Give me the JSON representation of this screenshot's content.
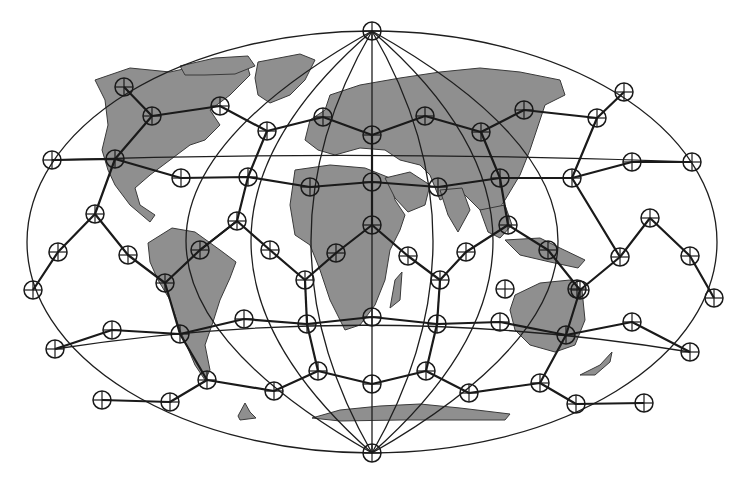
{
  "figure": {
    "type": "world-map-geodesic-network",
    "projection": "elliptical (Mollweide-like)",
    "colors": {
      "background": "#ffffff",
      "land": "#8f8f8f",
      "lines": "#1a1a1a"
    },
    "ellipse": {
      "cx": 372,
      "cy": 242,
      "rx": 345,
      "ry": 211
    }
  },
  "poles": [
    {
      "name": "north-pole-node",
      "x": 372,
      "y": 31
    },
    {
      "name": "south-pole-node",
      "x": 372,
      "y": 453
    }
  ],
  "nodes": [
    [
      124,
      87
    ],
    [
      152,
      116
    ],
    [
      220,
      106
    ],
    [
      267,
      131
    ],
    [
      323,
      117
    ],
    [
      372,
      135
    ],
    [
      425,
      116
    ],
    [
      481,
      132
    ],
    [
      524,
      110
    ],
    [
      597,
      118
    ],
    [
      624,
      92
    ],
    [
      52,
      160
    ],
    [
      115,
      159
    ],
    [
      181,
      178
    ],
    [
      248,
      177
    ],
    [
      310,
      187
    ],
    [
      372,
      182
    ],
    [
      438,
      187
    ],
    [
      500,
      178
    ],
    [
      572,
      178
    ],
    [
      632,
      162
    ],
    [
      692,
      162
    ],
    [
      95,
      214
    ],
    [
      128,
      255
    ],
    [
      58,
      252
    ],
    [
      200,
      250
    ],
    [
      237,
      221
    ],
    [
      270,
      250
    ],
    [
      336,
      253
    ],
    [
      372,
      225
    ],
    [
      408,
      256
    ],
    [
      466,
      252
    ],
    [
      508,
      225
    ],
    [
      548,
      250
    ],
    [
      580,
      290
    ],
    [
      620,
      257
    ],
    [
      650,
      218
    ],
    [
      690,
      256
    ],
    [
      714,
      298
    ],
    [
      33,
      290
    ],
    [
      165,
      283
    ],
    [
      305,
      280
    ],
    [
      372,
      317
    ],
    [
      440,
      280
    ],
    [
      505,
      289
    ],
    [
      577,
      289
    ],
    [
      55,
      349
    ],
    [
      112,
      330
    ],
    [
      180,
      334
    ],
    [
      244,
      319
    ],
    [
      307,
      324
    ],
    [
      437,
      324
    ],
    [
      500,
      322
    ],
    [
      566,
      335
    ],
    [
      632,
      322
    ],
    [
      690,
      352
    ],
    [
      102,
      400
    ],
    [
      170,
      402
    ],
    [
      207,
      380
    ],
    [
      274,
      391
    ],
    [
      318,
      371
    ],
    [
      372,
      384
    ],
    [
      426,
      371
    ],
    [
      469,
      393
    ],
    [
      540,
      383
    ],
    [
      576,
      404
    ],
    [
      644,
      403
    ]
  ],
  "edges": [
    [
      [
        124,
        87
      ],
      [
        152,
        116
      ],
      [
        220,
        106
      ],
      [
        267,
        131
      ],
      [
        323,
        117
      ],
      [
        372,
        135
      ],
      [
        425,
        116
      ],
      [
        481,
        132
      ],
      [
        524,
        110
      ],
      [
        597,
        118
      ],
      [
        624,
        92
      ]
    ],
    [
      [
        52,
        160
      ],
      [
        115,
        159
      ],
      [
        181,
        178
      ],
      [
        248,
        177
      ],
      [
        310,
        187
      ],
      [
        372,
        182
      ],
      [
        438,
        187
      ],
      [
        500,
        178
      ],
      [
        572,
        178
      ],
      [
        632,
        162
      ],
      [
        692,
        162
      ]
    ],
    [
      [
        152,
        116
      ],
      [
        115,
        159
      ],
      [
        95,
        214
      ],
      [
        58,
        252
      ],
      [
        33,
        290
      ]
    ],
    [
      [
        267,
        131
      ],
      [
        248,
        177
      ],
      [
        237,
        221
      ]
    ],
    [
      [
        372,
        135
      ],
      [
        372,
        182
      ],
      [
        372,
        225
      ]
    ],
    [
      [
        481,
        132
      ],
      [
        500,
        178
      ],
      [
        508,
        225
      ]
    ],
    [
      [
        597,
        118
      ],
      [
        572,
        178
      ],
      [
        620,
        257
      ]
    ],
    [
      [
        95,
        214
      ],
      [
        128,
        255
      ],
      [
        165,
        283
      ],
      [
        200,
        250
      ],
      [
        237,
        221
      ],
      [
        270,
        250
      ]
    ],
    [
      [
        237,
        221
      ],
      [
        200,
        250
      ]
    ],
    [
      [
        270,
        250
      ],
      [
        305,
        280
      ],
      [
        336,
        253
      ],
      [
        372,
        225
      ],
      [
        408,
        256
      ],
      [
        440,
        280
      ],
      [
        466,
        252
      ],
      [
        508,
        225
      ],
      [
        548,
        250
      ],
      [
        580,
        290
      ],
      [
        620,
        257
      ],
      [
        650,
        218
      ]
    ],
    [
      [
        650,
        218
      ],
      [
        690,
        256
      ],
      [
        714,
        298
      ]
    ],
    [
      [
        305,
        280
      ],
      [
        307,
        324
      ]
    ],
    [
      [
        440,
        280
      ],
      [
        437,
        324
      ]
    ],
    [
      [
        165,
        283
      ],
      [
        180,
        334
      ],
      [
        207,
        380
      ]
    ],
    [
      [
        580,
        290
      ],
      [
        566,
        335
      ],
      [
        540,
        383
      ]
    ],
    [
      [
        102,
        400
      ],
      [
        170,
        402
      ],
      [
        207,
        380
      ],
      [
        274,
        391
      ],
      [
        318,
        371
      ],
      [
        372,
        384
      ],
      [
        426,
        371
      ],
      [
        469,
        393
      ],
      [
        540,
        383
      ],
      [
        576,
        404
      ],
      [
        644,
        403
      ]
    ],
    [
      [
        318,
        371
      ],
      [
        307,
        324
      ]
    ],
    [
      [
        426,
        371
      ],
      [
        437,
        324
      ]
    ],
    [
      [
        55,
        349
      ],
      [
        112,
        330
      ],
      [
        180,
        334
      ],
      [
        244,
        319
      ],
      [
        307,
        324
      ],
      [
        372,
        317
      ],
      [
        437,
        324
      ],
      [
        500,
        322
      ],
      [
        566,
        335
      ],
      [
        632,
        322
      ],
      [
        690,
        352
      ]
    ]
  ]
}
